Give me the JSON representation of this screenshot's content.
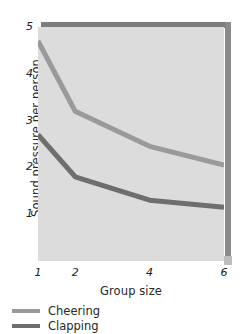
{
  "chart_data": {
    "type": "line",
    "title": "",
    "xlabel": "Group size",
    "ylabel": "Sound pressure per person",
    "x": [
      1,
      2,
      4,
      6
    ],
    "xtick_labels": [
      "1",
      "2",
      "4",
      "6"
    ],
    "ytick_labels": [
      "1",
      "2",
      "3",
      "4",
      "5"
    ],
    "xlim": [
      1,
      6
    ],
    "ylim": [
      0,
      5
    ],
    "grid": false,
    "legend_position": "below-left",
    "series": [
      {
        "name": "Cheering",
        "values": [
          4.7,
          3.2,
          2.45,
          2.05
        ],
        "color": "#9a9a9a"
      },
      {
        "name": "Clapping",
        "values": [
          2.7,
          1.8,
          1.3,
          1.15
        ],
        "color": "#6e6e6e"
      }
    ]
  },
  "axes": {
    "y_title": "Sound pressure per person",
    "x_title": "Group size",
    "y_ticks": [
      {
        "label": "1",
        "value": 1
      },
      {
        "label": "2",
        "value": 2
      },
      {
        "label": "3",
        "value": 3
      },
      {
        "label": "4",
        "value": 4
      },
      {
        "label": "5",
        "value": 5
      }
    ],
    "x_ticks": [
      {
        "label": "1",
        "value": 1
      },
      {
        "label": "2",
        "value": 2
      },
      {
        "label": "4",
        "value": 4
      },
      {
        "label": "6",
        "value": 6
      }
    ]
  },
  "legend": {
    "items": [
      {
        "label": "Cheering",
        "color": "#9a9a9a"
      },
      {
        "label": "Clapping",
        "color": "#6e6e6e"
      }
    ]
  },
  "colors": {
    "plot_background": "#dcdcdc",
    "frame_shadow": "#7d7d7d",
    "cheering": "#9a9a9a",
    "clapping": "#6e6e6e",
    "text": "#272727",
    "page_background": "#ffffff"
  }
}
